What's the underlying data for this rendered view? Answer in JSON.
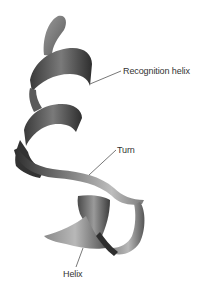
{
  "figure": {
    "labels": {
      "recognition_helix": "Recognition helix",
      "turn": "Turn",
      "helix": "Helix"
    },
    "colors": {
      "ribbon_dark": "#2e2e2e",
      "ribbon_mid": "#6e6e6e",
      "ribbon_light": "#b4b4b4",
      "leader_line": "#555555",
      "label_text": "#333333",
      "background": "#ffffff"
    }
  }
}
